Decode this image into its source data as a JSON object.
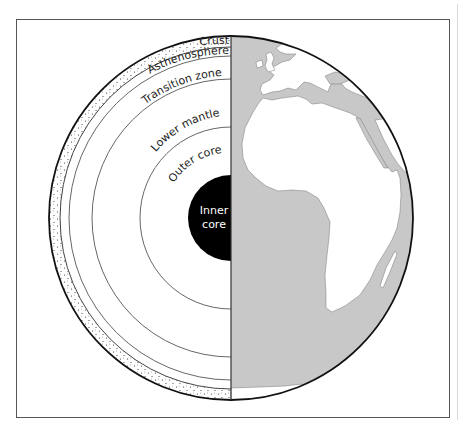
{
  "diagram": {
    "layers": [
      {
        "id": "crust",
        "label": "Crust"
      },
      {
        "id": "asthenosphere",
        "label": "Asthenosphere"
      },
      {
        "id": "transition",
        "label": "Transition zone"
      },
      {
        "id": "lower_mantle",
        "label": "Lower mantle"
      },
      {
        "id": "outer_core",
        "label": "Outer core"
      },
      {
        "id": "inner_core",
        "label_line1": "Inner",
        "label_line2": "core"
      }
    ],
    "map_half": "Africa and Europe",
    "colors": {
      "ocean": "#c8c8c8",
      "land": "#ffffff",
      "inner_core": "#000000",
      "lines": "#555555",
      "outline": "#111111"
    }
  }
}
